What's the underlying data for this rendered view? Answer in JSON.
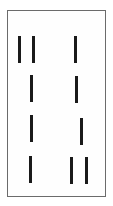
{
  "figure": {
    "canvas": {
      "width": 113,
      "height": 206,
      "background": "#ffffff"
    },
    "frame": {
      "label": "rectangular border frame",
      "x": 7,
      "y": 10,
      "width": 99,
      "height": 187,
      "border_width": 1,
      "border_color": "#6b6b6b",
      "fill_color": "#fefefe"
    },
    "mark_style": {
      "color": "#1a1a1a",
      "width": 3,
      "height": 27
    },
    "rows": [
      {
        "row_label": "row-1",
        "count": 3,
        "marks": [
          {
            "label": "mark-r1-c1",
            "x": 18,
            "y": 36,
            "width": 3,
            "height": 27,
            "column": "left"
          },
          {
            "label": "mark-r1-c2",
            "x": 32,
            "y": 36,
            "width": 3,
            "height": 27,
            "column": "left"
          },
          {
            "label": "mark-r1-c3",
            "x": 74,
            "y": 36,
            "width": 3,
            "height": 27,
            "column": "right"
          }
        ]
      },
      {
        "row_label": "row-2",
        "count": 2,
        "marks": [
          {
            "label": "mark-r2-c1",
            "x": 30,
            "y": 75,
            "width": 3,
            "height": 27,
            "column": "left"
          },
          {
            "label": "mark-r2-c2",
            "x": 75,
            "y": 76,
            "width": 3,
            "height": 27,
            "column": "right"
          }
        ]
      },
      {
        "row_label": "row-3",
        "count": 2,
        "marks": [
          {
            "label": "mark-r3-c1",
            "x": 30,
            "y": 115,
            "width": 3,
            "height": 27,
            "column": "left"
          },
          {
            "label": "mark-r3-c2",
            "x": 80,
            "y": 118,
            "width": 3,
            "height": 27,
            "column": "right"
          }
        ]
      },
      {
        "row_label": "row-4",
        "count": 3,
        "marks": [
          {
            "label": "mark-r4-c1",
            "x": 29,
            "y": 156,
            "width": 3,
            "height": 27,
            "column": "left"
          },
          {
            "label": "mark-r4-c2",
            "x": 70,
            "y": 157,
            "width": 3,
            "height": 27,
            "column": "right"
          },
          {
            "label": "mark-r4-c3",
            "x": 85,
            "y": 157,
            "width": 3,
            "height": 27,
            "column": "right"
          }
        ]
      }
    ],
    "total_marks": 10
  }
}
